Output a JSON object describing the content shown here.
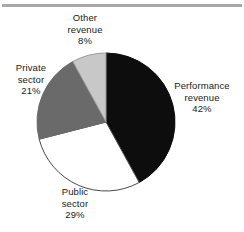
{
  "figure": {
    "width": 244,
    "height": 232,
    "background": "#ffffff",
    "rule_color": "#a9a9a9"
  },
  "chart_data": {
    "type": "pie",
    "title": "",
    "subtitle": "",
    "xlabel": "",
    "ylabel": "",
    "legend_position": "none",
    "grid": false,
    "label_style": "callout-text-outside",
    "start_angle_deg": 0,
    "direction": "clockwise",
    "center": {
      "x": 106,
      "y": 122
    },
    "radius": 69,
    "units": "percent",
    "total": 100,
    "categories": [
      "Performance revenue",
      "Public sector",
      "Private sector",
      "Other revenue"
    ],
    "values": [
      42,
      29,
      21,
      8
    ],
    "colors": [
      "#0d0d0d",
      "#ffffff",
      "#6a6a6a",
      "#c8c8c8"
    ],
    "slices": [
      {
        "name": "performance-revenue",
        "label_line1": "Performance",
        "label_line2": "revenue",
        "value_label": "42%",
        "value": 42,
        "color": "#0d0d0d",
        "stroke": "#0d0d0d",
        "start_deg": 0,
        "end_deg": 151.2
      },
      {
        "name": "public-sector",
        "label_line1": "Public",
        "label_line2": "sector",
        "value_label": "29%",
        "value": 29,
        "color": "#ffffff",
        "stroke": "#4a4a4a",
        "start_deg": 151.2,
        "end_deg": 255.6
      },
      {
        "name": "private-sector",
        "label_line1": "Private",
        "label_line2": "sector",
        "value_label": "21%",
        "value": 21,
        "color": "#6a6a6a",
        "stroke": "#6a6a6a",
        "start_deg": 255.6,
        "end_deg": 331.2
      },
      {
        "name": "other-revenue",
        "label_line1": "Other",
        "label_line2": "revenue",
        "value_label": "8%",
        "value": 8,
        "color": "#c8c8c8",
        "stroke": "#9a9a9a",
        "start_deg": 331.2,
        "end_deg": 360
      }
    ]
  },
  "footer": {
    "clipped_text": ""
  }
}
